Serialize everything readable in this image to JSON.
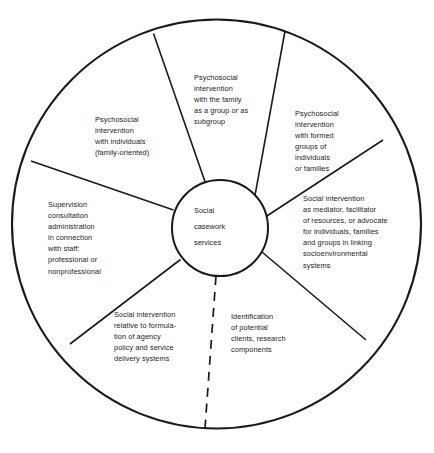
{
  "diagram": {
    "type": "radial-wheel",
    "center": {
      "label": "Social\ncasework\nservices"
    },
    "stroke_color": "#1a1a1a",
    "background_color": "#ffffff",
    "sectors": [
      {
        "id": "family-group",
        "label": "Psychosocial\nintervention\nwith the family\nas a group or as\nsubgroup"
      },
      {
        "id": "formed-groups",
        "label": "Psychosocial\nintervention\nwith formed\ngroups of\nindividuals\nor families"
      },
      {
        "id": "mediator",
        "label": "Social intervention\nas mediator, facilitator\nof resources, or advocate\nfor individuals, families\nand groups in linking\nsocioenvironmental\nsystems"
      },
      {
        "id": "identification",
        "label": "Identification\nof potential\nclients, research\ncomponents"
      },
      {
        "id": "policy",
        "label": "Social intervention\nrelative to formula-\ntion of agency\npolicy and service\ndelivery systems"
      },
      {
        "id": "supervision",
        "label": "Supervision\nconsultation\nadministration\nin connection\nwith staff:\nprofessional or\nnonprofessional"
      },
      {
        "id": "individuals",
        "label": "Psychosocial\nintervention\nwith individuals\n(family-oriented)"
      }
    ],
    "dividers": [
      {
        "id": "divider-upper-left",
        "style": "solid"
      },
      {
        "id": "divider-upper-right",
        "style": "solid"
      },
      {
        "id": "divider-right",
        "style": "solid"
      },
      {
        "id": "divider-lower-right",
        "style": "solid"
      },
      {
        "id": "divider-bottom",
        "style": "dashed"
      },
      {
        "id": "divider-lower-left",
        "style": "solid"
      },
      {
        "id": "divider-left",
        "style": "solid"
      }
    ]
  }
}
